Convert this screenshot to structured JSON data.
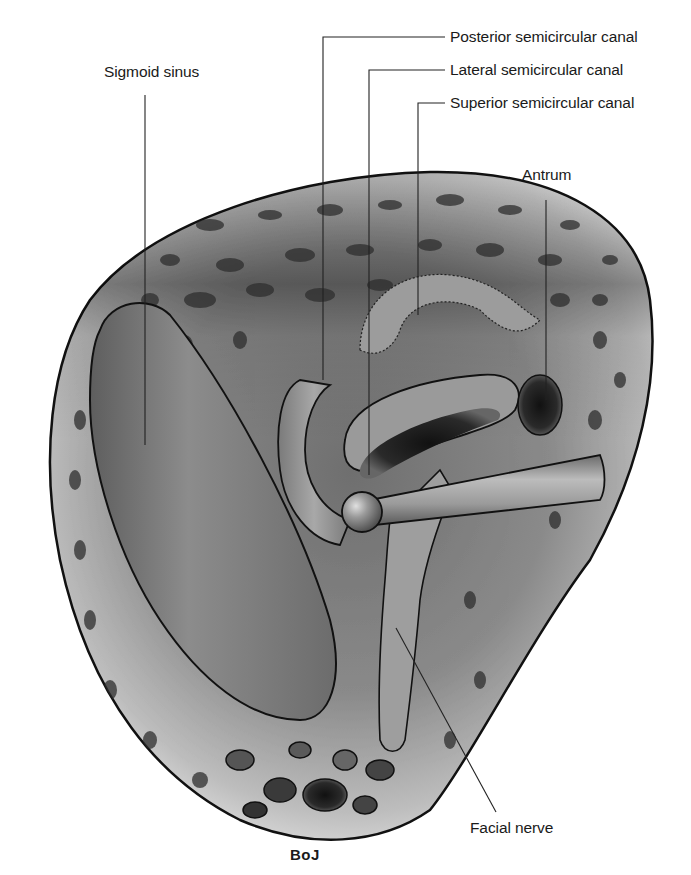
{
  "figure": {
    "labels": {
      "posterior_canal": "Posterior semicircular canal",
      "lateral_canal": "Lateral semicircular canal",
      "superior_canal": "Superior semicircular canal",
      "antrum": "Antrum",
      "sigmoid_sinus": "Sigmoid sinus",
      "facial_nerve": "Facial nerve"
    },
    "signature": "BoJ",
    "colors": {
      "background": "#ffffff",
      "outline": "#111111",
      "bone_light": "#d9d9d9",
      "bone_mid": "#9a9a9a",
      "bone_dark": "#3c3c3c",
      "structure_fill": "#8e8e8e",
      "leader_line": "#222222",
      "text": "#1a1a1a"
    }
  }
}
